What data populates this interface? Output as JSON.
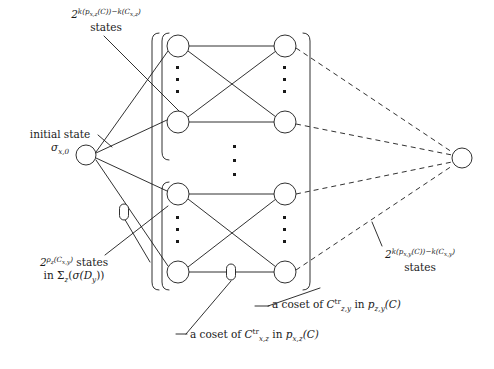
{
  "figure": {
    "type": "trellis-diagram",
    "background_color": "#ffffff",
    "line_color": "#1a1a1a"
  },
  "labels": {
    "top_states": {
      "line1_base": "2",
      "line1_exponent": "k(p",
      "line1_exp_sub1": "x,z",
      "line1_exp_mid": "(C))−k(C",
      "line1_exp_sub2": "x,z",
      "line1_exp_end": ")",
      "line2": "states",
      "plain": "2^{k(p_{x,z}(C))-k(C_{x,z})} states"
    },
    "initial_state": {
      "line1": "initial state",
      "sigma": "σ",
      "sigma_sub": "x,0",
      "plain": "initial state σ_{x,0}"
    },
    "bottom_left": {
      "base": "2",
      "exp_rho": "ρ",
      "exp_rho_sub": "z",
      "exp_arg": "(C",
      "exp_arg_sub": "x,y",
      "exp_arg_end": ")",
      "after": "states",
      "line2_in": "in",
      "line2_sigma_big": "Σ",
      "line2_sigma_big_sub": "z",
      "line2_rest_open": "(",
      "line2_sigma": "σ",
      "line2_d": "(D",
      "line2_d_sub": "y",
      "line2_close": "))",
      "plain": "2^{ρ_z(C_{x,y})} states in Σ_z(σ(D_y))"
    },
    "right_states": {
      "base": "2",
      "exponent_pre": "k(p",
      "exponent_sub1": "x,y",
      "exponent_mid": "(C))−k(C",
      "exponent_sub2": "x,y",
      "exponent_end": ")",
      "line2": "states",
      "plain": "2^{k(p_{x,y}(C))-k(C_{x,y})} states"
    },
    "coset_zy": {
      "prefix": "a coset of",
      "c": "C",
      "c_sup": "tr",
      "c_sub": "z,y",
      "in": "in",
      "p": "p",
      "p_sub": "z,y",
      "p_arg": "(C)",
      "plain": "a coset of C^{tr}_{z,y} in p_{z,y}(C)"
    },
    "coset_xz": {
      "prefix": "a coset of",
      "c": "C",
      "c_sup": "tr",
      "c_sub": "x,z",
      "in": "in",
      "p": "p",
      "p_sub": "x,z",
      "p_arg": "(C)",
      "plain": "a coset of C^{tr}_{x,z} in p_{x,z}(C)"
    }
  },
  "nodes": {
    "initial": {
      "cx": 86,
      "cy": 155,
      "r": 10
    },
    "final": {
      "cx": 462,
      "cy": 158,
      "r": 10
    },
    "group_top_left": [
      {
        "cx": 178,
        "cy": 46,
        "r": 11
      },
      {
        "cx": 178,
        "cy": 122,
        "r": 11
      }
    ],
    "group_top_right": [
      {
        "cx": 285,
        "cy": 46,
        "r": 11
      },
      {
        "cx": 285,
        "cy": 122,
        "r": 11
      }
    ],
    "group_bottom_left": [
      {
        "cx": 178,
        "cy": 194,
        "r": 11
      },
      {
        "cx": 178,
        "cy": 272,
        "r": 11
      }
    ],
    "group_bottom_right": [
      {
        "cx": 285,
        "cy": 194,
        "r": 11
      },
      {
        "cx": 285,
        "cy": 272,
        "r": 11
      }
    ]
  },
  "markers": {
    "oval_edge_left": {
      "cx": 124,
      "cy": 212,
      "rx": 4.5,
      "ry": 8
    },
    "oval_edge_bottom": {
      "cx": 231,
      "cy": 272,
      "rx": 4.5,
      "ry": 8
    }
  },
  "ellipses_dots": {
    "top_left_col": {
      "x": 178,
      "ys": [
        68,
        80,
        92
      ]
    },
    "top_right_col": {
      "x": 285,
      "ys": [
        68,
        80,
        92
      ]
    },
    "center_col": {
      "x": 235,
      "ys": [
        146,
        160,
        174
      ]
    },
    "bottom_left_col": {
      "x": 178,
      "ys": [
        218,
        230,
        242
      ]
    },
    "bottom_right_col": {
      "x": 285,
      "ys": [
        218,
        230,
        242
      ]
    }
  },
  "brackets": {
    "outer_left": {
      "x": 152,
      "y_top": 33,
      "y_bottom": 290
    },
    "inner_left_top": {
      "x": 162,
      "y_top": 33,
      "y_bottom": 160
    },
    "inner_left_bottom": {
      "x": 162,
      "y_top": 182,
      "y_bottom": 290
    },
    "right": {
      "x": 310,
      "y_top": 33,
      "y_bottom": 290
    }
  }
}
